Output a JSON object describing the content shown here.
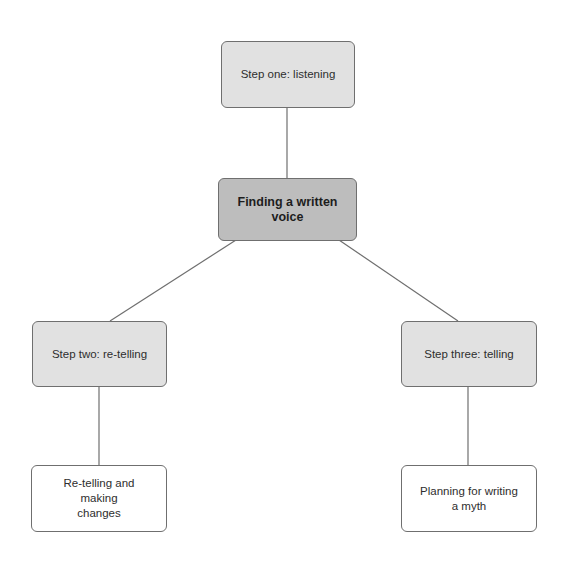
{
  "diagram": {
    "type": "tree",
    "colors": {
      "root_fill": "#bdbdbd",
      "step_fill": "#e1e1e1",
      "leaf_fill": "#ffffff",
      "border": "#6f6f6f",
      "line": "#6f6f6f"
    },
    "nodes": {
      "root": {
        "label": "Finding a written voice"
      },
      "step_one": {
        "label": "Step one: listening"
      },
      "step_two": {
        "label": "Step two: re-telling"
      },
      "step_three": {
        "label": "Step three: telling"
      },
      "leaf_two": {
        "label": "Re-telling and making changes"
      },
      "leaf_three": {
        "label": "Planning for writing a myth"
      }
    },
    "edges": [
      {
        "from": "step_one",
        "to": "root"
      },
      {
        "from": "root",
        "to": "step_two"
      },
      {
        "from": "root",
        "to": "step_three"
      },
      {
        "from": "step_two",
        "to": "leaf_two"
      },
      {
        "from": "step_three",
        "to": "leaf_three"
      }
    ]
  }
}
